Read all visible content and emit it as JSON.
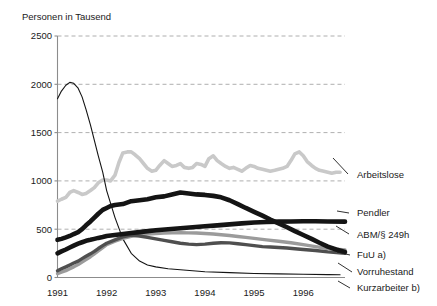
{
  "chart_data": {
    "type": "line",
    "title": "",
    "ylabel": "Personen in Tausend",
    "xlabel": "",
    "ylim": [
      0,
      2500
    ],
    "yticks": [
      0,
      500,
      1000,
      1500,
      2000,
      2500
    ],
    "ytick_labels": [
      "0",
      "500",
      "1000",
      "1500",
      "2000",
      "2500"
    ],
    "xlim": [
      1991.0,
      1996.85
    ],
    "xticks": [
      1991,
      1992,
      1993,
      1994,
      1995,
      1996
    ],
    "xtick_labels": [
      "1991",
      "1992",
      "1993",
      "1994",
      "1995",
      "1996"
    ],
    "grid": true,
    "legend_position": "right-inline-labels",
    "colors": {
      "Arbeitslose": "#c9c9c9",
      "Pendler": "#141414",
      "ABM": "#141414",
      "FuU": "#4f4f4f",
      "Vorruhestand": "#9b9b9b",
      "Kurzarbeiter": "#141414"
    },
    "series": [
      {
        "name": "Arbeitslose",
        "label": "Arbeitslose",
        "color": "#c9c9c9",
        "width": 3.6,
        "label_x": 357,
        "label_y": 178,
        "leader": [
          [
            348,
            174
          ],
          [
            333,
            158
          ]
        ],
        "x": [
          1991.0,
          1991.08,
          1991.17,
          1991.25,
          1991.33,
          1991.42,
          1991.5,
          1991.58,
          1991.67,
          1991.75,
          1991.83,
          1991.92,
          1992.0,
          1992.08,
          1992.17,
          1992.25,
          1992.33,
          1992.42,
          1992.5,
          1992.58,
          1992.67,
          1992.75,
          1992.83,
          1992.92,
          1993.0,
          1993.08,
          1993.17,
          1993.25,
          1993.33,
          1993.42,
          1993.5,
          1993.58,
          1993.67,
          1993.75,
          1993.83,
          1993.92,
          1994.0,
          1994.08,
          1994.17,
          1994.25,
          1994.33,
          1994.42,
          1994.5,
          1994.58,
          1994.67,
          1994.75,
          1994.83,
          1994.92,
          1995.0,
          1995.08,
          1995.17,
          1995.25,
          1995.33,
          1995.42,
          1995.5,
          1995.58,
          1995.67,
          1995.75,
          1995.83,
          1995.92,
          1996.0,
          1996.08,
          1996.17,
          1996.25,
          1996.33,
          1996.42,
          1996.5,
          1996.58,
          1996.67,
          1996.75
        ],
        "values": [
          790,
          810,
          830,
          880,
          900,
          880,
          860,
          870,
          900,
          930,
          980,
          1010,
          1010,
          1000,
          1060,
          1190,
          1290,
          1300,
          1300,
          1270,
          1230,
          1180,
          1130,
          1100,
          1110,
          1160,
          1210,
          1180,
          1150,
          1160,
          1180,
          1140,
          1130,
          1140,
          1180,
          1170,
          1150,
          1230,
          1260,
          1210,
          1180,
          1150,
          1130,
          1140,
          1120,
          1100,
          1130,
          1160,
          1150,
          1130,
          1120,
          1110,
          1100,
          1110,
          1120,
          1130,
          1150,
          1210,
          1280,
          1300,
          1260,
          1200,
          1160,
          1130,
          1110,
          1100,
          1090,
          1080,
          1090,
          1090
        ]
      },
      {
        "name": "Kurzarbeiter",
        "label": "Kurzarbeiter b)",
        "color": "#141414",
        "width": 1.1,
        "label_x": 357,
        "label_y": 291,
        "leader": [
          [
            350,
            288
          ],
          [
            338,
            281
          ]
        ],
        "x": [
          1991.0,
          1991.08,
          1991.17,
          1991.25,
          1991.33,
          1991.42,
          1991.5,
          1991.58,
          1991.67,
          1991.75,
          1991.83,
          1991.92,
          1992.0,
          1992.17,
          1992.33,
          1992.5,
          1992.67,
          1992.83,
          1993.0,
          1993.25,
          1993.5,
          1993.75,
          1994.0,
          1994.5,
          1995.0,
          1995.5,
          1996.0,
          1996.5,
          1996.75
        ],
        "values": [
          1850,
          1930,
          1990,
          2020,
          2010,
          1960,
          1870,
          1740,
          1580,
          1420,
          1260,
          1090,
          900,
          620,
          400,
          250,
          170,
          130,
          110,
          90,
          80,
          70,
          60,
          50,
          42,
          38,
          34,
          30,
          28
        ]
      },
      {
        "name": "ABM",
        "label": "ABM/§ 249h",
        "color": "#141414",
        "width": 4.6,
        "label_x": 357,
        "label_y": 238,
        "leader": [
          [
            349,
            234
          ],
          [
            336,
            226
          ]
        ],
        "x": [
          1991.0,
          1991.08,
          1991.17,
          1991.25,
          1991.33,
          1991.42,
          1991.5,
          1991.58,
          1991.67,
          1991.75,
          1991.83,
          1991.92,
          1992.0,
          1992.08,
          1992.17,
          1992.25,
          1992.33,
          1992.5,
          1992.67,
          1992.83,
          1993.0,
          1993.17,
          1993.33,
          1993.5,
          1993.67,
          1993.83,
          1994.0,
          1994.17,
          1994.33,
          1994.5,
          1994.67,
          1994.83,
          1995.0,
          1995.17,
          1995.33,
          1995.5,
          1995.67,
          1995.83,
          1996.0,
          1996.17,
          1996.33,
          1996.5,
          1996.67,
          1996.85
        ],
        "values": [
          390,
          400,
          415,
          430,
          450,
          470,
          500,
          540,
          580,
          620,
          660,
          700,
          720,
          740,
          750,
          755,
          760,
          790,
          800,
          810,
          830,
          840,
          860,
          880,
          870,
          860,
          855,
          845,
          830,
          800,
          760,
          720,
          680,
          640,
          600,
          560,
          520,
          480,
          440,
          400,
          360,
          320,
          290,
          265
        ]
      },
      {
        "name": "Pendler",
        "label": "Pendler",
        "color": "#141414",
        "width": 4.6,
        "label_x": 357,
        "label_y": 216,
        "leader": [
          [
            349,
            213
          ],
          [
            337,
            211
          ]
        ],
        "x": [
          1991.0,
          1991.08,
          1991.17,
          1991.25,
          1991.33,
          1991.42,
          1991.5,
          1991.58,
          1991.67,
          1991.75,
          1991.83,
          1991.92,
          1992.0,
          1992.25,
          1992.5,
          1992.75,
          1993.0,
          1993.25,
          1993.5,
          1993.75,
          1994.0,
          1994.25,
          1994.5,
          1994.75,
          1995.0,
          1995.25,
          1995.5,
          1995.75,
          1996.0,
          1996.25,
          1996.5,
          1996.85
        ],
        "values": [
          250,
          270,
          290,
          310,
          330,
          350,
          365,
          380,
          390,
          400,
          410,
          420,
          430,
          445,
          460,
          475,
          490,
          500,
          510,
          520,
          530,
          540,
          550,
          560,
          570,
          575,
          578,
          580,
          582,
          582,
          580,
          578
        ]
      },
      {
        "name": "FuU",
        "label": "FuU a)",
        "color": "#4f4f4f",
        "width": 3.4,
        "label_x": 357,
        "label_y": 258,
        "leader": [
          [
            350,
            255
          ],
          [
            337,
            252
          ]
        ],
        "x": [
          1991.0,
          1991.08,
          1991.17,
          1991.25,
          1991.33,
          1991.42,
          1991.5,
          1991.58,
          1991.67,
          1991.75,
          1991.83,
          1991.92,
          1992.0,
          1992.17,
          1992.33,
          1992.5,
          1992.67,
          1992.83,
          1993.0,
          1993.17,
          1993.33,
          1993.5,
          1993.67,
          1993.83,
          1994.0,
          1994.17,
          1994.33,
          1994.5,
          1994.67,
          1994.83,
          1995.0,
          1995.17,
          1995.33,
          1995.5,
          1995.67,
          1995.83,
          1996.0,
          1996.25,
          1996.5,
          1996.85
        ],
        "values": [
          70,
          90,
          110,
          130,
          150,
          170,
          195,
          220,
          245,
          270,
          300,
          330,
          355,
          390,
          420,
          440,
          430,
          415,
          400,
          385,
          370,
          355,
          345,
          340,
          345,
          355,
          360,
          358,
          350,
          340,
          330,
          320,
          315,
          310,
          305,
          298,
          290,
          280,
          265,
          250
        ]
      },
      {
        "name": "Vorruhestand",
        "label": "Vorruhestand",
        "color": "#9b9b9b",
        "width": 3.4,
        "label_x": 357,
        "label_y": 275,
        "leader": [
          [
            352,
            272
          ],
          [
            338,
            263
          ]
        ],
        "x": [
          1991.0,
          1991.08,
          1991.17,
          1991.25,
          1991.33,
          1991.42,
          1991.5,
          1991.58,
          1991.67,
          1991.75,
          1991.83,
          1991.92,
          1992.0,
          1992.17,
          1992.33,
          1992.5,
          1992.67,
          1992.83,
          1993.0,
          1993.17,
          1993.33,
          1993.5,
          1993.67,
          1993.83,
          1994.0,
          1994.17,
          1994.33,
          1994.5,
          1994.67,
          1994.83,
          1995.0,
          1995.25,
          1995.5,
          1995.75,
          1996.0,
          1996.25,
          1996.5,
          1996.85
        ],
        "values": [
          40,
          55,
          70,
          90,
          110,
          135,
          160,
          185,
          215,
          245,
          275,
          310,
          340,
          375,
          405,
          425,
          440,
          450,
          455,
          460,
          462,
          463,
          462,
          460,
          455,
          450,
          443,
          435,
          425,
          415,
          405,
          390,
          375,
          360,
          340,
          320,
          300,
          285
        ]
      }
    ]
  }
}
